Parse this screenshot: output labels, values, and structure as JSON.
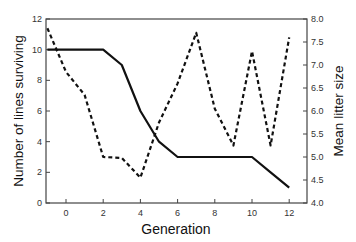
{
  "chart_data": {
    "type": "line",
    "title": "",
    "xlabel": "Generation",
    "ylabel": "Number of lines surviving",
    "y2label": "Mean litter size",
    "xlim": [
      -1.05,
      13
    ],
    "ylim": [
      0,
      12
    ],
    "y2lim": [
      4.0,
      8.0
    ],
    "xticks": [
      0,
      2,
      4,
      6,
      8,
      10,
      12
    ],
    "yticks": [
      0,
      2,
      4,
      6,
      8,
      10,
      12
    ],
    "y2ticks": [
      "4.0",
      "4.5",
      "5.0",
      "5.5",
      "6.0",
      "6.5",
      "7.0",
      "7.5",
      "8.0"
    ],
    "grid": false,
    "legend": "none",
    "series": [
      {
        "name": "Number of lines surviving",
        "axis": "left",
        "style": "solid",
        "x": [
          -1,
          0,
          1,
          2,
          3,
          4,
          5,
          6,
          7,
          8,
          9,
          10,
          11,
          12
        ],
        "values": [
          10,
          10,
          10,
          10,
          9,
          6,
          4,
          3,
          3,
          3,
          3,
          3,
          2,
          1
        ]
      },
      {
        "name": "Mean litter size",
        "axis": "right",
        "style": "dashed",
        "x": [
          -1,
          0,
          1,
          2,
          3,
          4,
          5,
          6,
          7,
          8,
          9,
          10,
          11,
          12
        ],
        "values": [
          7.8,
          6.85,
          6.35,
          5.0,
          4.98,
          4.55,
          5.75,
          6.6,
          7.7,
          6.05,
          5.25,
          7.3,
          5.25,
          7.6
        ]
      }
    ]
  }
}
